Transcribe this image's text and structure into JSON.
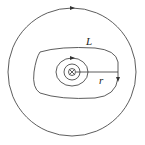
{
  "diagram": {
    "labels": {
      "loop": "L",
      "radius": "r"
    },
    "center_symbol": "current-into-page",
    "stroke_color": "#333333"
  }
}
